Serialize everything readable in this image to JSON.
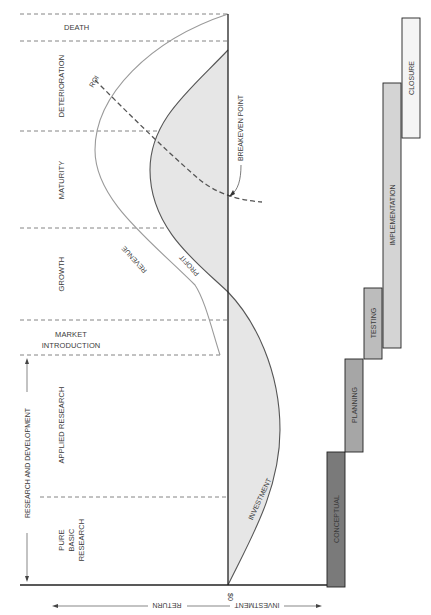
{
  "diagram": {
    "type": "project-life-cycle-vs-product-life-cycle",
    "phases": [
      {
        "id": "death",
        "label": "DEATH"
      },
      {
        "id": "deterioration",
        "label": "DETERIORATION"
      },
      {
        "id": "maturity",
        "label": "MATURITY"
      },
      {
        "id": "growth",
        "label": "GROWTH"
      },
      {
        "id": "market_intro_line1",
        "label": "MARKET"
      },
      {
        "id": "market_intro_line2",
        "label": "INTRODUCTION"
      },
      {
        "id": "applied_research",
        "label": "APPLIED RESEARCH"
      },
      {
        "id": "pure_line1",
        "label": "PURE"
      },
      {
        "id": "pure_line2",
        "label": "BASIC"
      },
      {
        "id": "pure_line3",
        "label": "RESEARCH"
      }
    ],
    "bracket_label": "RESEARCH AND DEVELOPMENT",
    "curves": {
      "roi": "ROI",
      "revenue": "REVENUE",
      "profit": "PROFIT",
      "investment": "INVESTMENT",
      "breakeven": "BREAKEVEN POINT"
    },
    "axis": {
      "zero_label": "$0",
      "return_label": "RETURN",
      "investment_label": "INVESTMENT"
    },
    "project_phases": [
      {
        "label": "CONCEPTUAL",
        "fill": "#7a7a7a"
      },
      {
        "label": "PLANNING",
        "fill": "#a6a6a6"
      },
      {
        "label": "TESTING",
        "fill": "#bcbcbc"
      },
      {
        "label": "IMPLEMENTATION",
        "fill": "#d4d4d4"
      },
      {
        "label": "CLOSURE",
        "fill": "#f4f4f4"
      }
    ],
    "colors": {
      "shade": "#e6e6e6",
      "revenue_line": "#9a9a9a",
      "profit_line": "#555555",
      "axis": "#222222"
    }
  }
}
